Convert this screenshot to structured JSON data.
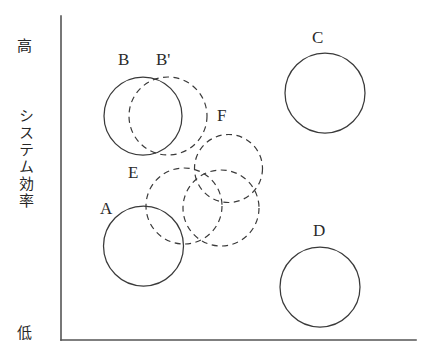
{
  "figure": {
    "background_color": "#ffffff",
    "stroke_color": "#3a3a3a",
    "axes": {
      "y_axis": {
        "label_high": "高",
        "label_low": "低",
        "label_name": "システム効率"
      },
      "x_axis": {
        "label": ""
      }
    },
    "labels": {
      "high": "高",
      "efficiency": "システム効率",
      "low": "低"
    },
    "circles": [
      {
        "id": "A",
        "label": "A",
        "style": "solid",
        "cx": 143.5,
        "cy": 246,
        "r": 40,
        "label_x": 100,
        "label_y": 199
      },
      {
        "id": "B",
        "label": "B",
        "style": "solid",
        "cx": 143,
        "cy": 116,
        "r": 39,
        "label_x": 118,
        "label_y": 50
      },
      {
        "id": "Bp",
        "label": "B'",
        "style": "dashed",
        "cx": 168,
        "cy": 116,
        "r": 39,
        "label_x": 156,
        "label_y": 50
      },
      {
        "id": "C",
        "label": "C",
        "style": "solid",
        "cx": 325,
        "cy": 93,
        "r": 40,
        "label_x": 312,
        "label_y": 28
      },
      {
        "id": "D",
        "label": "D",
        "style": "solid",
        "cx": 320,
        "cy": 287,
        "r": 40,
        "label_x": 313,
        "label_y": 221
      },
      {
        "id": "E",
        "label": "E",
        "style": "dashed",
        "cx": 184,
        "cy": 206,
        "r": 38,
        "label_x": 128,
        "label_y": 163
      },
      {
        "id": "F",
        "label": "F",
        "style": "dashed",
        "cx": 228.5,
        "cy": 168.5,
        "r": 34,
        "label_x": 217,
        "label_y": 106
      },
      {
        "id": "G",
        "label": "",
        "style": "dashed",
        "cx": 221,
        "cy": 208,
        "r": 38,
        "label_x": 0,
        "label_y": 0
      }
    ]
  }
}
